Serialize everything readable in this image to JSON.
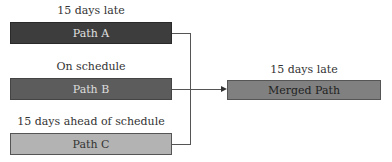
{
  "diagram": {
    "paths": [
      {
        "name": "Path A",
        "status": "15 days late",
        "color": "#3d3d3d",
        "text_color": "#e0e0e0"
      },
      {
        "name": "Path B",
        "status": "On schedule",
        "color": "#5c5c5c",
        "text_color": "#dcdcdc"
      },
      {
        "name": "Path C",
        "status": "15 days ahead of schedule",
        "color": "#b3b3b3",
        "text_color": "#333333"
      }
    ],
    "merged": {
      "name": "Merged Path",
      "status": "15 days late",
      "color": "#808080",
      "text_color": "#222222"
    }
  }
}
